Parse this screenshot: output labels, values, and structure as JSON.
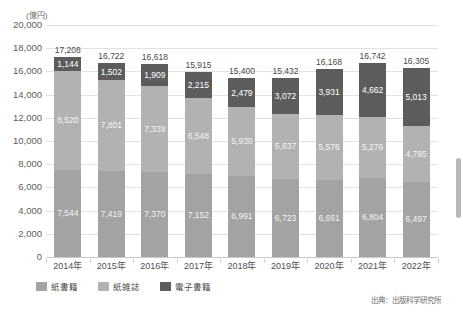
{
  "axis": {
    "unit_label": "(億円)",
    "y_ticks": [
      "20,000",
      "18,000",
      "16,000",
      "14,000",
      "12,000",
      "10,000",
      "8,000",
      "6,000",
      "4,000",
      "2,000",
      "0"
    ],
    "x_labels": [
      "2014年",
      "2015年",
      "2016年",
      "2017年",
      "2018年",
      "2019年",
      "2020年",
      "2021年",
      "2022年"
    ]
  },
  "legend": {
    "items": [
      {
        "label": "紙書籍",
        "color": "#a3a3a3",
        "swatch": "book"
      },
      {
        "label": "紙雑誌",
        "color": "#b2b2b2",
        "swatch": "mag"
      },
      {
        "label": "電子書籍",
        "color": "#5c5c5c",
        "swatch": "ebook"
      }
    ]
  },
  "source": {
    "text": "出典：出版科学研究所"
  },
  "scrollbar": {
    "name": "vertical-scrollbar"
  },
  "totals": [
    "17,208",
    "16,722",
    "16,618",
    "15,915",
    "15,400",
    "15,432",
    "16,168",
    "16,742",
    "16,305"
  ],
  "labels": {
    "ebook": [
      "1,144",
      "1,502",
      "1,909",
      "2,215",
      "2,479",
      "3,072",
      "3,931",
      "4,662",
      "5,013"
    ],
    "mag": [
      "8,520",
      "7,801",
      "7,339",
      "6,548",
      "5,930",
      "5,637",
      "5,576",
      "5,276",
      "4,795"
    ],
    "book": [
      "7,544",
      "7,419",
      "7,370",
      "7,152",
      "6,991",
      "6,723",
      "6,661",
      "6,804",
      "6,497"
    ]
  },
  "chart_data": {
    "type": "bar",
    "title": "",
    "subtitle": "",
    "xlabel": "",
    "ylabel": "(億円)",
    "ylim": [
      0,
      20000
    ],
    "ytick_step": 2000,
    "grid": true,
    "stacked": true,
    "legend_position": "bottom-left",
    "categories": [
      "2014年",
      "2015年",
      "2016年",
      "2017年",
      "2018年",
      "2019年",
      "2020年",
      "2021年",
      "2022年"
    ],
    "series": [
      {
        "name": "紙書籍",
        "color": "#a3a3a3",
        "values": [
          7544,
          7419,
          7370,
          7152,
          6991,
          6723,
          6661,
          6804,
          6497
        ]
      },
      {
        "name": "紙雑誌",
        "color": "#b2b2b2",
        "values": [
          8520,
          7801,
          7339,
          6548,
          5930,
          5637,
          5576,
          5276,
          4795
        ]
      },
      {
        "name": "電子書籍",
        "color": "#5c5c5c",
        "values": [
          1144,
          1502,
          1909,
          2215,
          2479,
          3072,
          3931,
          4662,
          5013
        ]
      }
    ],
    "totals": [
      17208,
      16722,
      16618,
      15915,
      15400,
      15432,
      16168,
      16742,
      16305
    ],
    "annotations": [
      "出典：出版科学研究所"
    ]
  }
}
